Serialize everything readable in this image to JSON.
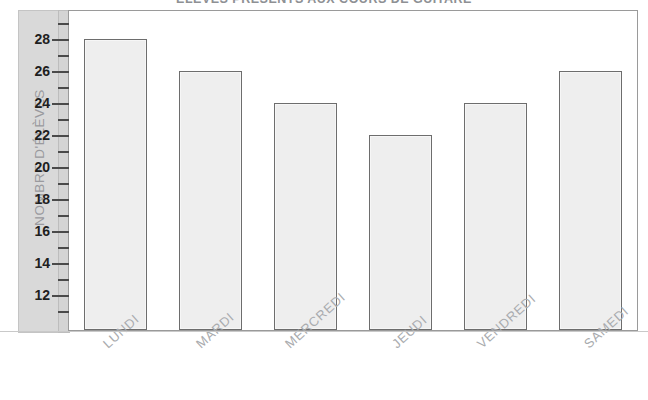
{
  "chart_data": {
    "type": "bar",
    "title": "ÉLÈVES PRÉSENTS AUX COURS DE GUITARE",
    "xlabel": "",
    "ylabel": "NOMBRE D'ÉLÈVES",
    "categories": [
      "LUNDI",
      "MARDI",
      "MERCREDI",
      "JEUDI",
      "VENDREDI",
      "SAMEDI"
    ],
    "values": [
      28,
      26,
      24,
      22,
      24,
      26
    ],
    "ylim": [
      10,
      30
    ],
    "y_ticks_major": [
      12,
      14,
      16,
      18,
      20,
      22,
      24,
      26,
      28
    ],
    "y_ticks_minor": [
      11,
      13,
      15,
      17,
      19,
      21,
      23,
      25,
      27,
      29
    ],
    "y_tick_labels": [
      "12",
      "14",
      "16",
      "18",
      "20",
      "22",
      "24",
      "26",
      "28"
    ],
    "grid": false,
    "legend": null,
    "bar_fill_color": "#eeeeee",
    "bar_edge_color": "#6d6d6d",
    "axis_band_color": "#d9d9d9",
    "tick_label_color": "#1f1f1f",
    "category_label_color": "#a9abae",
    "axis_title_color": "#9a9a9e",
    "title_color": "#8e9094"
  }
}
